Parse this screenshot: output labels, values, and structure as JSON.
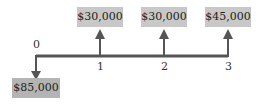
{
  "diagram": {
    "type": "cash-flow",
    "periods": [
      "0",
      "1",
      "2",
      "3"
    ],
    "flows": [
      {
        "period": "0",
        "label": "$85,000",
        "direction": "down"
      },
      {
        "period": "1",
        "label": "$30,000",
        "direction": "up"
      },
      {
        "period": "2",
        "label": "$30,000",
        "direction": "up"
      },
      {
        "period": "3",
        "label": "$45,000",
        "direction": "up"
      }
    ],
    "colors": {
      "line": "#555555",
      "box_in": "#c8c8c8",
      "box_out": "#b4b4b4"
    }
  }
}
